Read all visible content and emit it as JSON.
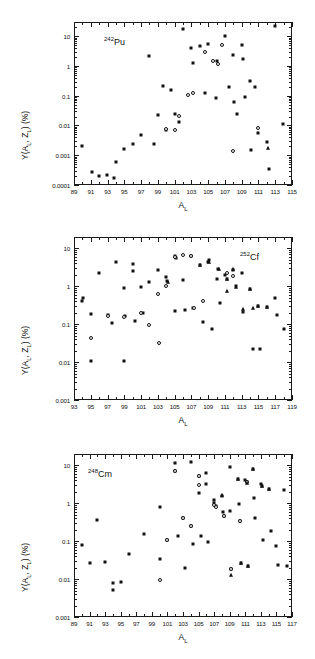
{
  "figure": {
    "axis_x_label": "A",
    "axis_x_sub": "L",
    "axis_y_label_pre": "Y(A",
    "axis_y_label_mid": ", Z",
    "axis_y_label_post": ")  (%)",
    "axis_y_sub": "L"
  },
  "chart_data": [
    {
      "type": "scatter",
      "title": "242Pu",
      "nuclide_mass": "242",
      "nuclide_symbol": "Pu",
      "xlabel": "A_L",
      "ylabel": "Y(A_L, Z_L) (%)",
      "xlim": [
        89,
        115
      ],
      "ylim": [
        0.0001,
        30
      ],
      "yscale": "log",
      "grid": false,
      "legend": "none",
      "xticks": [
        89,
        91,
        93,
        95,
        97,
        99,
        101,
        103,
        105,
        107,
        109,
        111,
        113,
        115
      ],
      "xticklabels": [
        "89",
        "91",
        "93",
        "95",
        "97",
        "99",
        "101",
        "103",
        "105",
        "107",
        "109",
        "111",
        "113",
        "115"
      ],
      "yticks": [
        0.0001,
        0.001,
        0.01,
        0.1,
        1,
        10
      ],
      "yticklabels": [
        "0.0001",
        "0.001",
        "0.01",
        "0.1",
        "1",
        "10"
      ],
      "series": [
        {
          "name": "filled-square",
          "marker": "square",
          "points": [
            [
              90.0,
              0.0021
            ],
            [
              91.1,
              0.00027
            ],
            [
              92.0,
              0.0002
            ],
            [
              92.9,
              0.00022
            ],
            [
              93.8,
              0.00017
            ],
            [
              94.0,
              0.0006
            ],
            [
              95.0,
              0.0016
            ],
            [
              96.0,
              0.0024
            ],
            [
              97.0,
              0.0047
            ],
            [
              98.0,
              2.1
            ],
            [
              98.6,
              0.0024
            ],
            [
              99.0,
              0.023
            ],
            [
              99.6,
              0.21
            ],
            [
              100.0,
              0.0068
            ],
            [
              100.6,
              0.15
            ],
            [
              101.0,
              0.025
            ],
            [
              101.5,
              0.013
            ],
            [
              102.0,
              18.0
            ],
            [
              102.9,
              3.9
            ],
            [
              103.2,
              1.3
            ],
            [
              104.0,
              4.6
            ],
            [
              104.6,
              0.12
            ],
            [
              105.0,
              5.6
            ],
            [
              105.9,
              0.085
            ],
            [
              106.1,
              1.45
            ],
            [
              107.0,
              10.0
            ],
            [
              107.5,
              0.2
            ],
            [
              108.0,
              2.4
            ],
            [
              108.1,
              0.062
            ],
            [
              108.4,
              0.024
            ],
            [
              109.0,
              5.1
            ],
            [
              109.1,
              1.7
            ],
            [
              109.4,
              0.088
            ],
            [
              110.0,
              0.31
            ],
            [
              110.1,
              0.0015
            ],
            [
              110.6,
              0.19
            ],
            [
              111.0,
              0.0055
            ],
            [
              112.0,
              0.0027
            ],
            [
              112.2,
              0.00035
            ],
            [
              113.9,
              0.011
            ],
            [
              113.0,
              22.0
            ]
          ]
        },
        {
          "name": "open-circle",
          "marker": "circle",
          "points": [
            [
              100.0,
              0.0078
            ],
            [
              101.0,
              0.0068
            ],
            [
              101.5,
              0.021
            ],
            [
              102.6,
              0.105
            ],
            [
              103.2,
              0.12
            ],
            [
              104.6,
              2.9
            ],
            [
              105.6,
              1.5
            ],
            [
              106.6,
              5.2
            ],
            [
              108.0,
              0.0014
            ],
            [
              110.9,
              0.0085
            ],
            [
              106.2,
              1.2
            ]
          ]
        },
        {
          "name": "filled-triangle",
          "marker": "triangle",
          "points": [
            [
              112.1,
              0.0018
            ]
          ]
        }
      ]
    },
    {
      "type": "scatter",
      "title": "252Cf",
      "nuclide_mass": "252",
      "nuclide_symbol": "Cf",
      "xlabel": "A_L",
      "ylabel": "Y(A_L, Z_L) (%)",
      "xlim": [
        93,
        119
      ],
      "ylim": [
        0.001,
        20
      ],
      "yscale": "log",
      "grid": false,
      "legend": "none",
      "xticks": [
        93,
        95,
        97,
        99,
        101,
        103,
        105,
        107,
        109,
        111,
        113,
        115,
        117,
        119
      ],
      "xticklabels": [
        "93",
        "95",
        "97",
        "99",
        "101",
        "103",
        "105",
        "107",
        "109",
        "111",
        "113",
        "115",
        "117",
        "119"
      ],
      "yticks": [
        0.001,
        0.01,
        0.1,
        1,
        10
      ],
      "yticklabels": [
        "0.001",
        "0.01",
        "0.1",
        "1",
        "10"
      ],
      "series": [
        {
          "name": "filled-square",
          "marker": "square",
          "points": [
            [
              94.0,
              0.41
            ],
            [
              94.1,
              0.5
            ],
            [
              95.0,
              0.19
            ],
            [
              96.0,
              2.3
            ],
            [
              97.0,
              0.17
            ],
            [
              97.5,
              0.105
            ],
            [
              98.0,
              4.3
            ],
            [
              99.0,
              0.9
            ],
            [
              99.1,
              0.16
            ],
            [
              100.0,
              3.9
            ],
            [
              100.0,
              2.5
            ],
            [
              100.3,
              0.12
            ],
            [
              101.0,
              0.98
            ],
            [
              101.2,
              0.2
            ],
            [
              102.0,
              1.3
            ],
            [
              103.0,
              2.7
            ],
            [
              104.0,
              1.75
            ],
            [
              104.1,
              1.35
            ],
            [
              105.0,
              6.2
            ],
            [
              105.2,
              5.5
            ],
            [
              105.1,
              0.22
            ],
            [
              106.0,
              1.5
            ],
            [
              106.2,
              0.24
            ],
            [
              107.0,
              6.3
            ],
            [
              107.2,
              0.27
            ],
            [
              108.0,
              3.6
            ],
            [
              108.4,
              0.115
            ],
            [
              109.0,
              4.5
            ],
            [
              109.1,
              4.9
            ],
            [
              109.4,
              0.073
            ],
            [
              110.0,
              1.55
            ],
            [
              110.2,
              2.9
            ],
            [
              110.4,
              0.36
            ],
            [
              111.0,
              2.0
            ],
            [
              111.2,
              1.6
            ],
            [
              112.0,
              2.7
            ],
            [
              112.3,
              1.0
            ],
            [
              113.0,
              2.2
            ],
            [
              113.2,
              0.21
            ],
            [
              114.0,
              0.83
            ],
            [
              114.3,
              0.022
            ],
            [
              115.2,
              0.022
            ],
            [
              115.0,
              0.3
            ],
            [
              116.0,
              0.28
            ],
            [
              117.0,
              0.48
            ],
            [
              117.2,
              0.18
            ],
            [
              118.0,
              0.077
            ],
            [
              95.0,
              0.011
            ],
            [
              99.0,
              0.0108
            ]
          ]
        },
        {
          "name": "open-circle",
          "marker": "circle",
          "points": [
            [
              95.0,
              0.044
            ],
            [
              97.0,
              0.16
            ],
            [
              99.0,
              0.155
            ],
            [
              101.0,
              0.2
            ],
            [
              102.0,
              0.098
            ],
            [
              103.0,
              0.62
            ],
            [
              103.1,
              0.032
            ],
            [
              104.0,
              1.05
            ],
            [
              105.0,
              5.8
            ],
            [
              106.0,
              6.5
            ],
            [
              107.0,
              6.4
            ],
            [
              107.3,
              0.27
            ],
            [
              108.4,
              0.42
            ],
            [
              111.3,
              2.3
            ],
            [
              112.0,
              1.9
            ]
          ]
        },
        {
          "name": "filled-triangle",
          "marker": "triangle",
          "points": [
            [
              104.2,
              1.3
            ],
            [
              108.0,
              3.6
            ],
            [
              110.3,
              2.9
            ],
            [
              111.2,
              1.6
            ],
            [
              111.3,
              0.77
            ],
            [
              112.0,
              2.9
            ],
            [
              112.3,
              0.95
            ],
            [
              113.2,
              0.25
            ],
            [
              114.0,
              0.85
            ],
            [
              114.3,
              0.27
            ],
            [
              115.0,
              0.3
            ],
            [
              116.0,
              0.28
            ],
            [
              109.1,
              4.4
            ]
          ]
        }
      ]
    },
    {
      "type": "scatter",
      "title": "248Cm",
      "nuclide_mass": "248",
      "nuclide_symbol": "Cm",
      "xlabel": "A_L",
      "ylabel": "Y(A_L, Z_L) (%)",
      "xlim": [
        89,
        117
      ],
      "ylim": [
        0.001,
        20
      ],
      "yscale": "log",
      "grid": false,
      "legend": "none",
      "xticks": [
        89,
        91,
        93,
        95,
        97,
        99,
        101,
        103,
        105,
        107,
        109,
        111,
        113,
        115,
        117
      ],
      "xticklabels": [
        "89",
        "91",
        "93",
        "95",
        "97",
        "99",
        "101",
        "103",
        "105",
        "107",
        "109",
        "111",
        "113",
        "115",
        "117"
      ],
      "yticks": [
        0.001,
        0.01,
        0.1,
        1,
        10
      ],
      "yticklabels": [
        "0.001",
        "0.01",
        "0.1",
        "1",
        "10"
      ],
      "series": [
        {
          "name": "filled-square",
          "marker": "square",
          "points": [
            [
              90.0,
              0.078
            ],
            [
              91.0,
              0.027
            ],
            [
              92.0,
              0.36
            ],
            [
              93.0,
              0.028
            ],
            [
              94.0,
              0.0078
            ],
            [
              94.0,
              0.0053
            ],
            [
              95.0,
              0.0085
            ],
            [
              96.0,
              0.047
            ],
            [
              98.0,
              0.155
            ],
            [
              100.0,
              0.033
            ],
            [
              100.0,
              0.82
            ],
            [
              101.0,
              0.105
            ],
            [
              102.0,
              11.5
            ],
            [
              102.0,
              7.0
            ],
            [
              102.3,
              0.135
            ],
            [
              103.0,
              0.4
            ],
            [
              103.2,
              0.02
            ],
            [
              104.0,
              12.0
            ],
            [
              104.0,
              0.25
            ],
            [
              104.3,
              0.085
            ],
            [
              105.0,
              5.2
            ],
            [
              105.0,
              1.85
            ],
            [
              105.3,
              0.135
            ],
            [
              106.0,
              6.2
            ],
            [
              106.0,
              3.2
            ],
            [
              106.2,
              0.098
            ],
            [
              107.0,
              1.2
            ],
            [
              107.0,
              1.05
            ],
            [
              107.3,
              0.85
            ],
            [
              108.0,
              1.6
            ],
            [
              108.2,
              0.6
            ],
            [
              108.3,
              0.45
            ],
            [
              109.0,
              9.2
            ],
            [
              109.0,
              0.62
            ],
            [
              109.2,
              0.019
            ],
            [
              110.0,
              4.3
            ],
            [
              110.2,
              0.95
            ],
            [
              110.3,
              0.35
            ],
            [
              110.4,
              0.027
            ],
            [
              111.0,
              4.2
            ],
            [
              111.2,
              3.6
            ],
            [
              111.3,
              0.022
            ],
            [
              112.0,
              8.0
            ],
            [
              112.1,
              1.35
            ],
            [
              112.3,
              0.4
            ],
            [
              113.0,
              3.2
            ],
            [
              113.1,
              2.9
            ],
            [
              113.3,
              0.105
            ],
            [
              114.0,
              2.4
            ],
            [
              114.3,
              0.19
            ],
            [
              115.0,
              0.073
            ],
            [
              115.2,
              0.023
            ],
            [
              116.0,
              2.3
            ],
            [
              116.3,
              0.022
            ]
          ]
        },
        {
          "name": "open-circle",
          "marker": "circle",
          "points": [
            [
              100.0,
              0.0095
            ],
            [
              101.0,
              0.105
            ],
            [
              102.0,
              7.0
            ],
            [
              103.0,
              0.4
            ],
            [
              104.0,
              0.25
            ],
            [
              105.0,
              5.2
            ],
            [
              105.0,
              3.0
            ],
            [
              107.0,
              0.9
            ],
            [
              107.2,
              0.82
            ],
            [
              108.3,
              0.45
            ],
            [
              109.2,
              0.019
            ],
            [
              111.2,
              3.6
            ],
            [
              110.3,
              0.35
            ]
          ]
        },
        {
          "name": "filled-triangle",
          "marker": "triangle",
          "points": [
            [
              108.0,
              1.7
            ],
            [
              109.2,
              0.0125
            ],
            [
              110.0,
              4.4
            ],
            [
              111.2,
              3.5
            ],
            [
              112.0,
              8.0
            ],
            [
              113.1,
              2.9
            ],
            [
              114.0,
              2.4
            ],
            [
              110.4,
              0.027
            ],
            [
              111.3,
              0.022
            ]
          ]
        }
      ]
    }
  ]
}
